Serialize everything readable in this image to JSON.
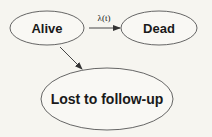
{
  "diagram": {
    "type": "state-transition",
    "background_color": "#f6f5f0",
    "stroke_color": "#444444",
    "nodes": [
      {
        "id": "alive",
        "label": "Alive"
      },
      {
        "id": "dead",
        "label": "Dead"
      },
      {
        "id": "lost",
        "label": "Lost to follow-up"
      }
    ],
    "edges": [
      {
        "from": "alive",
        "to": "dead",
        "label": "λ(t)"
      },
      {
        "from": "alive",
        "to": "lost",
        "label": ""
      }
    ]
  }
}
